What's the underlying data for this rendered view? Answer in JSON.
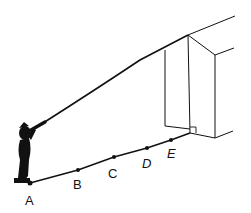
{
  "diagram": {
    "title": "",
    "points": [
      {
        "label": "A",
        "x": 30,
        "y": 183
      },
      {
        "label": "B",
        "x": 78,
        "y": 170
      },
      {
        "label": "C",
        "x": 114,
        "y": 157
      },
      {
        "label": "D",
        "x": 147,
        "y": 148
      },
      {
        "label": "E",
        "x": 171,
        "y": 140
      }
    ],
    "elements": [
      "observer-with-telescope",
      "sight-line-to-roof",
      "ground-line",
      "building",
      "right-angle-marker"
    ],
    "colors": {
      "ink": "#111111",
      "background": "#ffffff"
    }
  }
}
